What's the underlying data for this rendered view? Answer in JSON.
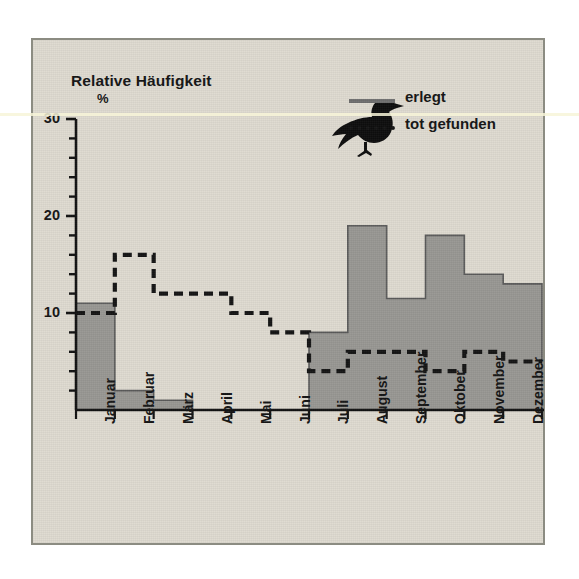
{
  "figure": {
    "background_color": "#dedad0",
    "frame_color": "#8c8c82",
    "axis_title": "Relative Häufigkeit",
    "unit_label": "%"
  },
  "legend": {
    "position": "top-right",
    "items": [
      {
        "label": "erlegt",
        "style": "solid",
        "color": "#6e6e6e",
        "key_name": "erlegt-line-key"
      },
      {
        "label": "tot gefunden",
        "style": "dashed",
        "color": "#141414",
        "key_name": "tot-gefunden-dash-key"
      }
    ],
    "decoration_icon": "duck-silhouette-icon"
  },
  "chart_data": {
    "type": "bar",
    "title": "Relative Häufigkeit",
    "xlabel": "",
    "ylabel": "Relative Häufigkeit",
    "yunit": "%",
    "ylim": [
      0,
      30
    ],
    "yticks": [
      0,
      2,
      4,
      6,
      8,
      10,
      12,
      14,
      16,
      18,
      20,
      22,
      24,
      26,
      28,
      30
    ],
    "ytick_labels_shown": [
      "10",
      "20",
      "30"
    ],
    "grid": false,
    "categories": [
      "Januar",
      "Februar",
      "März",
      "April",
      "Mai",
      "Juni",
      "Juli",
      "August",
      "September",
      "Oktober",
      "November",
      "Dezember"
    ],
    "series": [
      {
        "name": "erlegt",
        "style": "step-filled",
        "color": "#6e6e6e",
        "values": [
          11,
          2,
          1,
          0,
          0,
          0,
          8,
          19,
          11.5,
          18,
          14,
          13
        ]
      },
      {
        "name": "tot gefunden",
        "style": "step-dashed",
        "color": "#141414",
        "values": [
          10,
          16,
          12,
          12,
          10,
          8,
          4,
          6,
          6,
          4,
          6,
          5
        ]
      }
    ]
  }
}
